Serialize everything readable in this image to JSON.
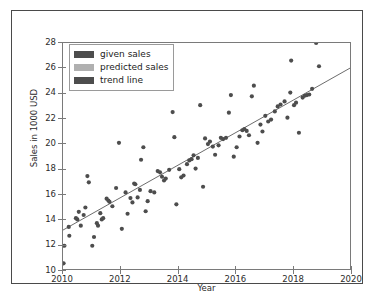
{
  "chart_data": {
    "type": "scatter",
    "title": "",
    "xlabel": "Year",
    "ylabel": "Sales in 1000 USD",
    "xlim": [
      2010,
      2020
    ],
    "ylim": [
      10,
      28
    ],
    "xticks": [
      2010,
      2012,
      2014,
      2016,
      2018,
      2020
    ],
    "yticks": [
      10,
      12,
      14,
      16,
      18,
      20,
      22,
      24,
      26,
      28
    ],
    "grid": false,
    "legend_position": "upper left",
    "legend": [
      {
        "label": "given sales",
        "color": "#4d4d4d",
        "marker": "circle"
      },
      {
        "label": "predicted sales",
        "color": "#b0b0b0",
        "marker": "circle"
      },
      {
        "label": "trend line",
        "color": "#4d4d4d",
        "marker": "line"
      }
    ],
    "series": [
      {
        "name": "given sales",
        "color": "#4d4d4d",
        "points": [
          [
            2010.02,
            10.45
          ],
          [
            2010.05,
            11.85
          ],
          [
            2010.2,
            13.35
          ],
          [
            2010.22,
            12.65
          ],
          [
            2010.45,
            14.05
          ],
          [
            2010.5,
            13.95
          ],
          [
            2010.55,
            14.55
          ],
          [
            2010.62,
            13.45
          ],
          [
            2010.72,
            14.3
          ],
          [
            2010.78,
            14.9
          ],
          [
            2010.85,
            17.4
          ],
          [
            2010.9,
            16.9
          ],
          [
            2011.02,
            11.85
          ],
          [
            2011.08,
            12.55
          ],
          [
            2011.18,
            13.65
          ],
          [
            2011.22,
            13.45
          ],
          [
            2011.3,
            14.45
          ],
          [
            2011.35,
            13.95
          ],
          [
            2011.4,
            14.05
          ],
          [
            2011.52,
            15.6
          ],
          [
            2011.58,
            15.45
          ],
          [
            2011.62,
            15.35
          ],
          [
            2011.72,
            15.0
          ],
          [
            2011.85,
            16.45
          ],
          [
            2011.95,
            20.05
          ],
          [
            2012.05,
            13.2
          ],
          [
            2012.18,
            16.1
          ],
          [
            2012.25,
            14.4
          ],
          [
            2012.35,
            15.65
          ],
          [
            2012.42,
            15.3
          ],
          [
            2012.48,
            16.8
          ],
          [
            2012.52,
            16.75
          ],
          [
            2012.6,
            15.7
          ],
          [
            2012.68,
            16.3
          ],
          [
            2012.72,
            18.7
          ],
          [
            2012.8,
            19.7
          ],
          [
            2012.88,
            14.6
          ],
          [
            2012.95,
            15.4
          ],
          [
            2013.05,
            16.2
          ],
          [
            2013.18,
            16.1
          ],
          [
            2013.3,
            17.8
          ],
          [
            2013.38,
            17.7
          ],
          [
            2013.45,
            17.35
          ],
          [
            2013.52,
            17.05
          ],
          [
            2013.58,
            17.2
          ],
          [
            2013.7,
            17.9
          ],
          [
            2013.82,
            22.5
          ],
          [
            2013.88,
            20.5
          ],
          [
            2013.95,
            15.15
          ],
          [
            2014.05,
            17.95
          ],
          [
            2014.12,
            17.3
          ],
          [
            2014.2,
            17.45
          ],
          [
            2014.32,
            18.35
          ],
          [
            2014.4,
            18.65
          ],
          [
            2014.48,
            18.75
          ],
          [
            2014.55,
            19.05
          ],
          [
            2014.62,
            18.0
          ],
          [
            2014.7,
            18.85
          ],
          [
            2014.78,
            23.05
          ],
          [
            2014.88,
            16.55
          ],
          [
            2014.95,
            20.4
          ],
          [
            2015.05,
            19.95
          ],
          [
            2015.12,
            20.15
          ],
          [
            2015.22,
            19.75
          ],
          [
            2015.3,
            19.1
          ],
          [
            2015.42,
            19.85
          ],
          [
            2015.5,
            20.45
          ],
          [
            2015.58,
            20.35
          ],
          [
            2015.68,
            20.45
          ],
          [
            2015.78,
            22.45
          ],
          [
            2015.85,
            23.85
          ],
          [
            2015.95,
            18.95
          ],
          [
            2016.05,
            19.7
          ],
          [
            2016.15,
            20.55
          ],
          [
            2016.25,
            21.05
          ],
          [
            2016.32,
            21.15
          ],
          [
            2016.4,
            21.0
          ],
          [
            2016.48,
            20.65
          ],
          [
            2016.58,
            23.75
          ],
          [
            2016.65,
            24.6
          ],
          [
            2016.78,
            20.05
          ],
          [
            2016.88,
            21.5
          ],
          [
            2016.95,
            20.95
          ],
          [
            2017.05,
            22.2
          ],
          [
            2017.15,
            21.75
          ],
          [
            2017.25,
            21.9
          ],
          [
            2017.38,
            22.55
          ],
          [
            2017.48,
            22.95
          ],
          [
            2017.58,
            23.1
          ],
          [
            2017.72,
            23.35
          ],
          [
            2017.82,
            22.05
          ],
          [
            2017.92,
            24.05
          ],
          [
            2017.95,
            26.6
          ],
          [
            2018.05,
            23.05
          ],
          [
            2018.12,
            23.25
          ],
          [
            2018.22,
            20.85
          ],
          [
            2018.35,
            23.65
          ],
          [
            2018.42,
            23.8
          ],
          [
            2018.5,
            23.85
          ],
          [
            2018.58,
            23.9
          ],
          [
            2018.68,
            24.35
          ],
          [
            2018.82,
            28.0
          ],
          [
            2018.92,
            26.15
          ]
        ]
      }
    ],
    "trend_line": {
      "name": "trend line",
      "color": "#5a5a5a",
      "x": [
        2010.0,
        2020.0
      ],
      "y": [
        13.1,
        26.0
      ]
    }
  }
}
